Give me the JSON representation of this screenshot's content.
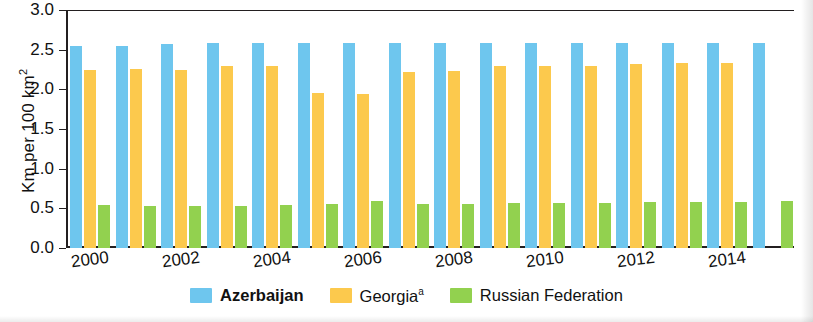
{
  "chart_data": {
    "type": "bar",
    "title": "",
    "xlabel": "",
    "ylabel": "Km per 100 km",
    "ylabel_sup": "2",
    "ylim": [
      0,
      3.0
    ],
    "yticks": [
      "0.0",
      "0.5",
      "1.0",
      "1.5",
      "2.0",
      "2.5",
      "3.0"
    ],
    "ytick_values": [
      0.0,
      0.5,
      1.0,
      1.5,
      2.0,
      2.5,
      3.0
    ],
    "grid": false,
    "legend_position": "bottom-center",
    "categories": [
      "2000",
      "2001",
      "2002",
      "2003",
      "2004",
      "2005",
      "2006",
      "2007",
      "2008",
      "2009",
      "2010",
      "2011",
      "2012",
      "2013",
      "2014",
      "2015"
    ],
    "xtick_labels": [
      "2000",
      "2002",
      "2004",
      "2006",
      "2008",
      "2010",
      "2012",
      "2014"
    ],
    "series": [
      {
        "name": "Azerbaijan",
        "color": "#6ec6ee",
        "bold": true,
        "values": [
          2.55,
          2.55,
          2.57,
          2.58,
          2.58,
          2.58,
          2.58,
          2.58,
          2.58,
          2.58,
          2.58,
          2.58,
          2.58,
          2.58,
          2.58,
          2.58
        ]
      },
      {
        "name": "Georgia",
        "color": "#fcc94d",
        "superscript": "a",
        "bold": false,
        "values": [
          2.24,
          2.26,
          2.25,
          2.29,
          2.29,
          1.95,
          1.94,
          2.22,
          2.23,
          2.29,
          2.3,
          2.3,
          2.32,
          2.33,
          2.33,
          null
        ]
      },
      {
        "name": "Russian Federation",
        "color": "#92d14f",
        "bold": false,
        "values": [
          0.54,
          0.53,
          0.53,
          0.53,
          0.54,
          0.55,
          0.59,
          0.56,
          0.56,
          0.57,
          0.57,
          0.57,
          0.58,
          0.58,
          0.58,
          0.59
        ]
      }
    ]
  }
}
